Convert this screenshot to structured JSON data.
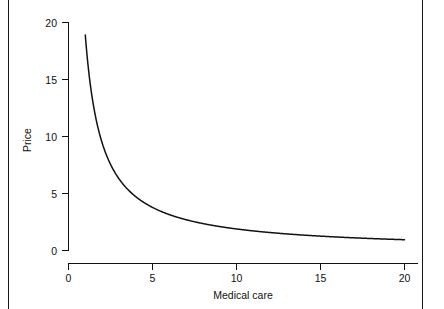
{
  "figure": {
    "background_color": "#ffffff",
    "line_color": "#111111",
    "border_color": "#1a1a1a"
  },
  "chart_data": {
    "type": "line",
    "title": "",
    "subtitle": "",
    "xlabel": "Medical care",
    "ylabel": "Price",
    "xlim": [
      0,
      21
    ],
    "ylim": [
      0,
      20
    ],
    "xticks": [
      0,
      5,
      10,
      15,
      20
    ],
    "yticks": [
      0,
      5,
      10,
      15,
      20
    ],
    "xtick_labels": [
      "0",
      "5",
      "10",
      "15",
      "20"
    ],
    "ytick_labels": [
      "0",
      "5",
      "10",
      "15",
      "20"
    ],
    "grid": false,
    "legend": false,
    "legend_position": "none",
    "annotations": [],
    "series": [
      {
        "name": "Demand curve",
        "relationship": "y = 20 / x",
        "x": [
          1.0,
          1.25,
          1.5,
          1.75,
          2.0,
          2.25,
          2.5,
          2.75,
          3.0,
          3.5,
          4.0,
          4.5,
          5.0,
          5.5,
          6.0,
          6.5,
          7.0,
          7.5,
          8.0,
          9.0,
          10.0,
          11.0,
          12.0,
          13.0,
          14.0,
          15.0,
          16.0,
          17.0,
          18.0,
          19.0,
          20.0
        ],
        "y": [
          18.9,
          16.0,
          13.3,
          11.4,
          10.0,
          8.9,
          8.0,
          7.3,
          6.7,
          5.7,
          5.0,
          4.4,
          4.0,
          3.6,
          3.3,
          3.1,
          2.9,
          2.7,
          2.5,
          2.2,
          2.0,
          1.8,
          1.7,
          1.5,
          1.4,
          1.3,
          1.25,
          1.2,
          1.1,
          1.05,
          1.0
        ]
      }
    ]
  },
  "axis_titles": {
    "x": "Medical care",
    "y": "Price"
  },
  "tick_labels": {
    "y_20": "20",
    "y_15": "15",
    "y_10": "10",
    "y_5": "5",
    "y_0": "0",
    "x_0": "0",
    "x_5": "5",
    "x_10": "10",
    "x_15": "15",
    "x_20": "20"
  }
}
